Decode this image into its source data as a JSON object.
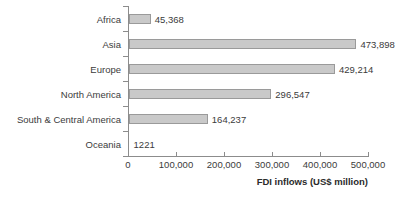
{
  "chart_data": {
    "type": "bar",
    "orientation": "horizontal",
    "title": "",
    "xlabel": "FDI inflows (US$ million)",
    "ylabel": "",
    "categories": [
      "Africa",
      "Asia",
      "Europe",
      "North America",
      "South & Central America",
      "Oceania"
    ],
    "values": [
      45368,
      473898,
      429214,
      296547,
      164237,
      1221
    ],
    "value_labels": [
      "45,368",
      "473,898",
      "429,214",
      "296,547",
      "164,237",
      "1221"
    ],
    "xlim": [
      0,
      500000
    ],
    "xticks": [
      0,
      100000,
      200000,
      300000,
      400000,
      500000
    ],
    "xtick_labels": [
      "0",
      "100,000",
      "200,000",
      "300,000",
      "400,000",
      "500,000"
    ],
    "grid": false,
    "legend": false,
    "bar_fill_color": "#c9c9c9",
    "bar_border_color": "#9a9a9a",
    "axis_color": "#8c8c8c",
    "text_color": "#3b3b3b",
    "background_color": "#ffffff"
  }
}
